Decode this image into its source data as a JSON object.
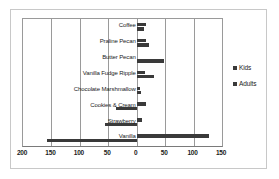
{
  "chart_data": {
    "type": "bar",
    "orientation": "horizontal",
    "layout": "diverging",
    "title": "",
    "xlabel": "",
    "ylabel": "",
    "grid": true,
    "legend_position": "right",
    "xlim": [
      -200,
      150
    ],
    "xticks": [
      -200,
      -150,
      -100,
      -50,
      0,
      50,
      100,
      150
    ],
    "xtick_labels": [
      "200",
      "150",
      "100",
      "50",
      "0",
      "50",
      "100",
      "150"
    ],
    "categories": [
      "Coffee",
      "Praline Pecan",
      "Butter Pecan",
      "Vanilla Fudge Ripple",
      "Chocolate Marshmallow",
      "Cookies & Cream",
      "Strawberry",
      "Vanilla"
    ],
    "series": [
      {
        "name": "Kids",
        "values": [
          17,
          17,
          0,
          14,
          5,
          17,
          10,
          127
        ]
      },
      {
        "name": "Adults",
        "values": [
          12,
          22,
          48,
          30,
          8,
          -37,
          -55,
          -158
        ]
      }
    ]
  },
  "legend": {
    "entries": [
      {
        "label": "Kids"
      },
      {
        "label": "Adults"
      }
    ]
  }
}
